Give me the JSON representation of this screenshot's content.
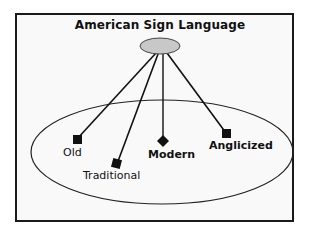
{
  "diagram": {
    "title": "American Sign Language",
    "root": {
      "name": "American Sign Language",
      "shape": "ellipse",
      "fill": "#c8c8c8"
    },
    "group_ellipse": {
      "fill": "none",
      "stroke": "#222222"
    },
    "nodes": [
      {
        "label": "Old",
        "marker": "square"
      },
      {
        "label": "Traditional",
        "marker": "square"
      },
      {
        "label": "Modern",
        "marker": "diamond"
      },
      {
        "label": "Anglicized",
        "marker": "square"
      }
    ],
    "edges": [
      {
        "from": "American Sign Language",
        "to": "Old"
      },
      {
        "from": "American Sign Language",
        "to": "Traditional"
      },
      {
        "from": "American Sign Language",
        "to": "Modern"
      },
      {
        "from": "American Sign Language",
        "to": "Anglicized"
      }
    ]
  }
}
